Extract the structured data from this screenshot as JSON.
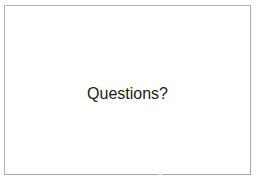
{
  "slide": {
    "title": "Questions?",
    "background_color": "#ffffff",
    "border_color": "#b4b4b4",
    "text_color": "#1a1a1a"
  },
  "canvas": {
    "background_color": "#ffffff"
  }
}
